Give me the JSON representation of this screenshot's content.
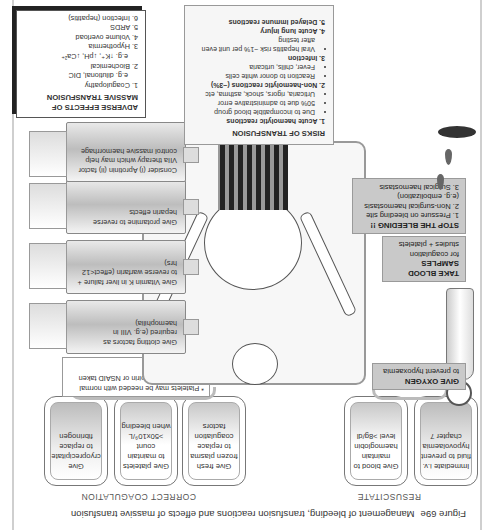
{
  "caption": {
    "figure_number": "Figure 69e",
    "title": "Management of bleeding, transfusion reactions and effects of massive transfusion"
  },
  "sections": {
    "resuscitate": "RESUSCITATE",
    "correct_coagulation": "CORRECT COAGULATION"
  },
  "boxes": [
    {
      "text": "Immediate i.v. fluid to prevent hypovolaemia chapter 7"
    },
    {
      "text": "Give blood to maintain haemoglobin level >8g/dl"
    },
    {
      "text": "Give fresh frozen plasma to replace coagulation factors"
    },
    {
      "text": "Give platelets to maintain count >50x10⁹/L when bleeding"
    },
    {
      "text": "Give cryoprecipitate to replace fibrinogen"
    }
  ],
  "platelet_note": "* Platelets may be needed with normal platelet count if aspirin or NSAID taken recently",
  "syringes": [
    {
      "text": "Give clotting factors as required (e.g. VIII in haemophilia)"
    },
    {
      "text": "Give Vitamin K in liver failure + to reverse warfarin (effect<12 hrs)"
    },
    {
      "text": "Give protamine to reverse heparin effects"
    },
    {
      "text": "Consider (i) Aprotinin (ii) factor VIIa therapy which may help control massive haemorrhage"
    }
  ],
  "labels": {
    "oxygen": {
      "title": "GIVE OXYGEN",
      "body": "to prevent hypoxaemia"
    },
    "blood_samples": {
      "title": "TAKE BLOOD SAMPLES",
      "body": "for coagulation studies + platelets"
    },
    "stop_bleeding": {
      "title": "STOP THE BLEEDING !!",
      "items": [
        "1. Pressure on bleeding site",
        "2. Non-surgical haemostasis (e.g. embolization)",
        "3. Surgical haemostasis"
      ]
    }
  },
  "risks": {
    "title": "RISKS OF TRANSFUSION",
    "items": [
      {
        "heading": "1. Acute haemolytic reactions",
        "bullets": [
          "Due to incompatible blood group",
          "50% due to administrative error",
          "Urticaria, rigors, shock, asthma, etc"
        ]
      },
      {
        "heading": "2. Non-haemolytic reactions (~3%)",
        "bullets": [
          "Reaction to donor white cells",
          "Fever, chills, urticaria"
        ]
      },
      {
        "heading": "3. Infection",
        "bullets": [
          "Viral hepatitis risk ~1% per unit even after testing"
        ]
      },
      {
        "heading": "4. Acute lung injury",
        "bullets": []
      },
      {
        "heading": "5. Delayed immune reactions",
        "bullets": []
      }
    ]
  },
  "adverse": {
    "title": "ADVERSE EFFECTS OF MASSIVE TRANSFUSION",
    "items": [
      "1. Coagulopathy",
      "e.g. dilutional, DIC",
      "2. Biochemical",
      "e.g. ↑K⁺, ↓pH, ↓Ca²⁺",
      "3. Hypothermia",
      "4. Volume overload",
      "5. ARDS",
      "6. Infection (hepatitis)"
    ]
  }
}
